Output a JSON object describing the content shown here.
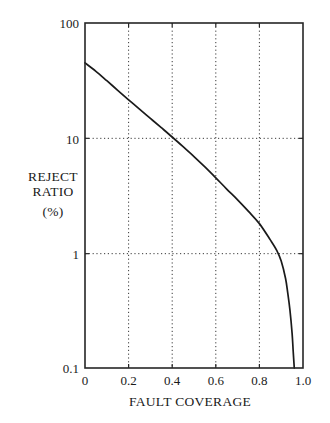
{
  "chart_data": {
    "type": "line",
    "title": "",
    "xlabel": "FAULT COVERAGE",
    "ylabel": "REJECT RATIO (%)",
    "ylabel_lines": [
      "REJECT",
      "RATIO",
      "(%)"
    ],
    "xlim": [
      0,
      1.0
    ],
    "ylim": [
      0.1,
      100
    ],
    "yscale": "log",
    "xscale": "linear",
    "grid": true,
    "grid_x_values": [
      0.2,
      0.4,
      0.6,
      0.8
    ],
    "grid_y_values": [
      1,
      10
    ],
    "legend": "none",
    "xticks": [
      0,
      0.2,
      0.4,
      0.6,
      0.8,
      1.0
    ],
    "xtick_labels": [
      "0",
      "0.2",
      "0.4",
      "0.6",
      "0.8",
      "1.0"
    ],
    "yticks": [
      0.1,
      1,
      10,
      100
    ],
    "ytick_labels": [
      "0.1",
      "1",
      "10",
      "100"
    ],
    "series": [
      {
        "name": "reject ratio",
        "x": [
          0.0,
          0.05,
          0.1,
          0.15,
          0.2,
          0.25,
          0.3,
          0.35,
          0.4,
          0.45,
          0.5,
          0.55,
          0.6,
          0.65,
          0.7,
          0.75,
          0.8,
          0.85,
          0.88,
          0.9,
          0.92,
          0.93,
          0.94,
          0.95,
          0.955,
          0.96
        ],
        "y": [
          45.0,
          38.0,
          31.5,
          26.0,
          21.5,
          17.8,
          14.8,
          12.3,
          10.2,
          8.4,
          6.9,
          5.6,
          4.5,
          3.6,
          2.9,
          2.3,
          1.8,
          1.3,
          1.05,
          0.85,
          0.6,
          0.45,
          0.32,
          0.2,
          0.14,
          0.1
        ]
      }
    ]
  },
  "axis": {
    "y_top_label": "100",
    "y_mid_high_label": "10",
    "y_mid_low_label": "1",
    "y_bottom_label": "0.1",
    "x_labels": [
      "0",
      "0.2",
      "0.4",
      "0.6",
      "0.8",
      "1.0"
    ],
    "x_title": "FAULT COVERAGE",
    "y_title_line1": "REJECT",
    "y_title_line2": "RATIO",
    "y_title_line3": "(%)"
  },
  "colors": {
    "curve": "#1a1a1a",
    "frame": "#262626",
    "grid": "#3a3a3a",
    "background": "#ffffff",
    "text": "#1a1a1a"
  }
}
